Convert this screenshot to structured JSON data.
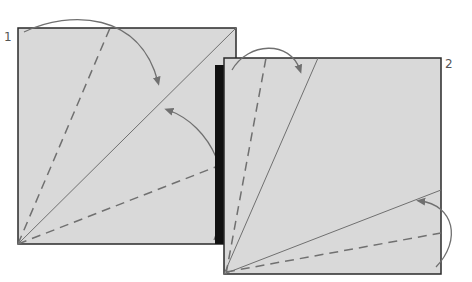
{
  "diagram": {
    "type": "origami-fold-instructions",
    "steps": [
      {
        "number": "1",
        "label_pos": {
          "x": 4,
          "y": 30
        }
      },
      {
        "number": "2",
        "label_pos": {
          "x": 445,
          "y": 57
        }
      }
    ],
    "colors": {
      "paper": "#d9d9d9",
      "outline": "#2a2a2a",
      "fold_line": "#707070",
      "arrow": "#707070",
      "shadow_edge": "#111111"
    }
  }
}
